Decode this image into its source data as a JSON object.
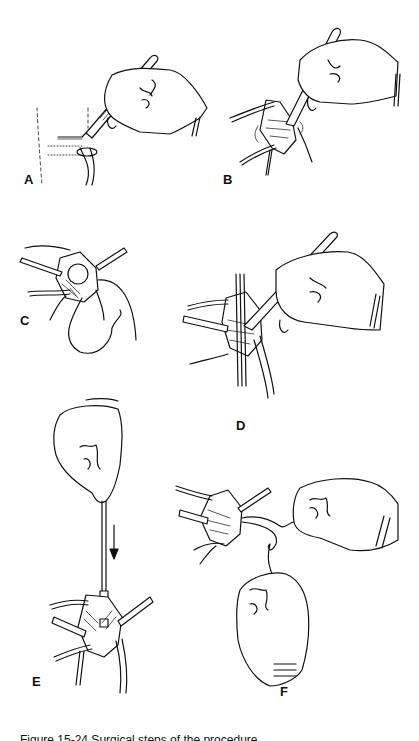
{
  "figure": {
    "panels": [
      {
        "id": "A",
        "label": "A",
        "description": "Hand holding scalpel making skin incision over joint"
      },
      {
        "id": "B",
        "label": "B",
        "description": "Scalpel dissection within retracted incision"
      },
      {
        "id": "C",
        "label": "C",
        "description": "Retracted wound with suture loop"
      },
      {
        "id": "D",
        "label": "D",
        "description": "Scalpel incision of exposed structure between retractors"
      },
      {
        "id": "E",
        "label": "E",
        "description": "Fingers lowering instrument along guide into wound (arrow down)"
      },
      {
        "id": "F",
        "label": "F",
        "description": "Two hands tying suture ends from retracted wound"
      }
    ],
    "caption": "Figure 15-24 Surgical steps of the procedure"
  }
}
